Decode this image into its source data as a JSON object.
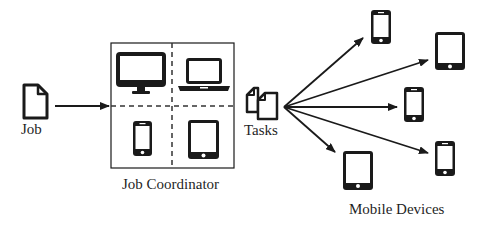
{
  "diagram": {
    "job": {
      "label": "Job",
      "icon": "document-icon"
    },
    "coordinator": {
      "label": "Job Coordinator",
      "cells": [
        {
          "device": "desktop-monitor",
          "icon": "monitor-icon"
        },
        {
          "device": "laptop",
          "icon": "laptop-icon"
        },
        {
          "device": "smartphone",
          "icon": "phone-icon"
        },
        {
          "device": "tablet",
          "icon": "tablet-icon"
        }
      ]
    },
    "tasks": {
      "label": "Tasks",
      "icon": "documents-icon"
    },
    "mobile_devices": {
      "label": "Mobile Devices",
      "devices": [
        {
          "type": "phone",
          "icon": "phone-icon"
        },
        {
          "type": "tablet",
          "icon": "tablet-icon"
        },
        {
          "type": "phone",
          "icon": "phone-icon"
        },
        {
          "type": "phone",
          "icon": "phone-icon"
        },
        {
          "type": "tablet",
          "icon": "tablet-icon"
        }
      ]
    },
    "colors": {
      "stroke": "#1a1a1a",
      "background": "#ffffff"
    }
  }
}
